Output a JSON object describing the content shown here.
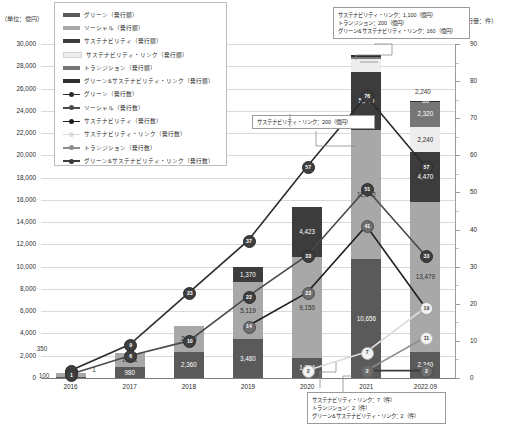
{
  "axes": {
    "left_unit": "（単位：億円）",
    "right_unit": "（発行量：件）",
    "y_ticks": [
      "30,000",
      "28,000",
      "26,000",
      "24,000",
      "22,000",
      "20,000",
      "18,000",
      "16,000",
      "14,000",
      "12,000",
      "10,000",
      "8,000",
      "6,000",
      "4,000",
      "2,000",
      "0"
    ],
    "y2_ticks": [
      "90",
      "80",
      "70",
      "60",
      "50",
      "40",
      "30",
      "20",
      "10",
      "0"
    ],
    "x_ticks": [
      "2016",
      "2017",
      "2018",
      "2019",
      "2020",
      "2021",
      "2022.09"
    ]
  },
  "legend": {
    "items": [
      {
        "label": "グリーン（発行額）",
        "kind": "bar",
        "color": "#5a5a5a"
      },
      {
        "label": "ソーシャル（発行額）",
        "kind": "bar",
        "color": "#a8a8a8"
      },
      {
        "label": "サステナビリティ（発行額）",
        "kind": "bar",
        "color": "#3c3c3c"
      },
      {
        "label": "サステナビリティ・リンク（発行額）",
        "kind": "bar",
        "color": "#ededed"
      },
      {
        "label": "トランジション（発行額）",
        "kind": "bar",
        "color": "#767676"
      },
      {
        "label": "グリーン&サステナビリティ・リンク（発行額）",
        "kind": "bar",
        "color": "#2e2e2e"
      },
      {
        "label": "グリーン（発行数）",
        "kind": "line",
        "color": "#2b2b2b"
      },
      {
        "label": "ソーシャル（発行数）",
        "kind": "line",
        "color": "#4a4a4a"
      },
      {
        "label": "サステナビリティ（発行数）",
        "kind": "line",
        "color": "#1f1f1f"
      },
      {
        "label": "サステナビリティ・リンク（発行数）",
        "kind": "line",
        "color": "#dcdcdc"
      },
      {
        "label": "トランジション（発行数）",
        "kind": "line",
        "color": "#8d8d8d"
      },
      {
        "label": "グリーン&サステナビリティ・リンク（発行数）",
        "kind": "line",
        "color": "#3a3a3a"
      }
    ]
  },
  "callouts": {
    "top": [
      "サステナビリティ・リンク：1,100（億円）",
      "トランジション：200（億円）",
      "グリーン&サステナビリティ・リンク：160（億円）"
    ],
    "middle": [
      "サステナビリティ・リンク：200（億円）"
    ],
    "bottom": [
      "サステナビリティ・リンク：7（件）",
      "トランジション：2（件）",
      "グリーン&サステナビリティ・リンク：2（件）"
    ]
  },
  "chart_data": {
    "type": "bar",
    "title": "",
    "xlabel": "",
    "ylabel": "（単位：億円）",
    "y2label": "（発行量：件）",
    "ylim": [
      0,
      30000
    ],
    "y2lim": [
      0,
      90
    ],
    "grid": true,
    "legend_position": "inside-top-left",
    "categories": [
      "2016",
      "2017",
      "2018",
      "2019",
      "2020",
      "2021",
      "2022.09"
    ],
    "bar_series": [
      {
        "name": "グリーン（発行額）",
        "color": "#5a5a5a",
        "values": [
          100,
          980,
          2360,
          3480,
          1754,
          10656,
          2340
        ],
        "labels": [
          "100",
          "980",
          "2,360",
          "3,480",
          "1,754",
          "10,656",
          "2,340"
        ]
      },
      {
        "name": "ソーシャル（発行額）",
        "color": "#a8a8a8",
        "values": [
          350,
          1231,
          2323,
          5119,
          9150,
          11642,
          13479
        ],
        "labels": [
          "350",
          "1,231",
          "2,323",
          "5,119",
          "9,150",
          "11,642",
          "13,479"
        ]
      },
      {
        "name": "サステナビリティ（発行額）",
        "color": "#3c3c3c",
        "values": [
          0,
          0,
          0,
          1370,
          4423,
          5210,
          4470
        ],
        "labels": [
          "",
          "",
          "",
          "1,370",
          "4,423",
          "5,210",
          "4,470"
        ]
      },
      {
        "name": "サステナビリティ・リンク（発行額）",
        "color": "#ededed",
        "values": [
          0,
          0,
          0,
          0,
          0,
          1100,
          2240
        ],
        "labels": [
          "",
          "",
          "",
          "",
          "",
          "",
          "2,240"
        ]
      },
      {
        "name": "トランジション（発行額）",
        "color": "#767676",
        "values": [
          0,
          0,
          0,
          0,
          0,
          200,
          2320
        ],
        "labels": [
          "",
          "",
          "",
          "",
          "",
          "",
          "2,320"
        ]
      },
      {
        "name": "グリーン&サステナビリティ・リンク（発行額）",
        "color": "#2e2e2e",
        "values": [
          0,
          0,
          0,
          0,
          0,
          160,
          66
        ],
        "labels": [
          "",
          "",
          "",
          "",
          "",
          "",
          "66"
        ]
      }
    ],
    "line_series": [
      {
        "name": "グリーン（発行数）",
        "color": "#2b2b2b",
        "values": [
          2,
          9,
          23,
          37,
          57,
          76,
          57
        ],
        "labels": [
          "2",
          "9",
          "23",
          "37",
          "57",
          "76",
          "57"
        ]
      },
      {
        "name": "ソーシャル（発行数）",
        "color": "#4a4a4a",
        "values": [
          1,
          6,
          10,
          22,
          33,
          51,
          33
        ],
        "labels": [
          "1",
          "6",
          "10",
          "22",
          "33",
          "51",
          "33"
        ]
      },
      {
        "name": "サステナビリティ（発行数）",
        "color": "#1f1f1f",
        "values": [
          0,
          0,
          0,
          14,
          23,
          41,
          19
        ],
        "labels": [
          "",
          "",
          "",
          "14",
          "23",
          "41",
          "19"
        ]
      },
      {
        "name": "サステナビリティ・リンク（発行数）",
        "color": "#dcdcdc",
        "values": [
          0,
          0,
          0,
          0,
          2,
          7,
          19
        ],
        "labels": [
          "",
          "",
          "",
          "",
          "2",
          "7",
          "19"
        ]
      },
      {
        "name": "トランジション（発行数）",
        "color": "#8d8d8d",
        "values": [
          0,
          0,
          0,
          0,
          0,
          2,
          11
        ],
        "labels": [
          "",
          "",
          "",
          "",
          "",
          "2",
          "11"
        ]
      },
      {
        "name": "グリーン&サステナビリティ・リンク（発行数）",
        "color": "#3a3a3a",
        "values": [
          0,
          0,
          0,
          0,
          0,
          2,
          2
        ],
        "labels": [
          "",
          "",
          "",
          "",
          "",
          "2",
          "2"
        ]
      }
    ],
    "annotations": {
      "2021_top_box": [
        "サステナビリティ・リンク：1,100（億円）",
        "トランジション：200（億円）",
        "グリーン&サステナビリティ・リンク：160（億円）"
      ],
      "2020_box": [
        "サステナビリティ・リンク：200（億円）"
      ],
      "2021_bottom_box": [
        "サステナビリティ・リンク：7（件）",
        "トランジション：2（件）",
        "グリーン&サステナビリティ・リンク：2（件）"
      ]
    }
  }
}
